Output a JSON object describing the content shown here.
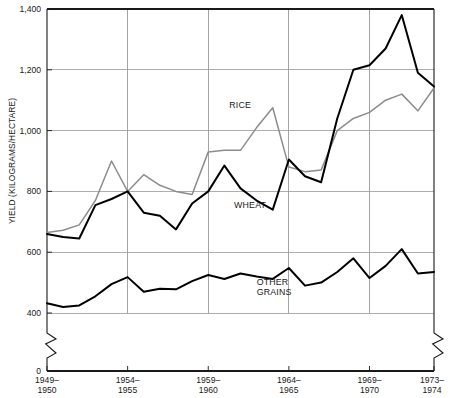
{
  "chart_data": {
    "type": "line",
    "title": "",
    "xlabel": "",
    "ylabel": "YIELD (KILOGRAMS/HECTARE)",
    "ylim": [
      0,
      1400
    ],
    "yticks": [
      0,
      400,
      600,
      800,
      1000,
      1200,
      1400
    ],
    "ytick_labels": [
      "0",
      "400",
      "600",
      "800",
      "1,000",
      "1,200",
      "1,400"
    ],
    "y_axis_break": {
      "present": true,
      "between": [
        0,
        400
      ],
      "note": "zigzag break on both left and right axes"
    },
    "grid": "horizontal and vertical gridlines at labeled ticks",
    "legend_position": "inline labels on plot",
    "xticks": [
      0,
      5,
      10,
      15,
      20,
      24
    ],
    "xtick_labels": [
      {
        "top": "1949–",
        "bottom": "1950"
      },
      {
        "top": "1954–",
        "bottom": "1955"
      },
      {
        "top": "1959–",
        "bottom": "1960"
      },
      {
        "top": "1964–",
        "bottom": "1965"
      },
      {
        "top": "1969–",
        "bottom": "1970"
      },
      {
        "top": "1973–",
        "bottom": "1974"
      }
    ],
    "x": [
      0,
      1,
      2,
      3,
      4,
      5,
      6,
      7,
      8,
      9,
      10,
      11,
      12,
      13,
      14,
      15,
      16,
      17,
      18,
      19,
      20,
      21,
      22,
      23,
      24
    ],
    "series": [
      {
        "name": "RICE",
        "color": "#8c8c8c",
        "label_x": 11.3,
        "label_y": 1075,
        "values": [
          665,
          672,
          690,
          770,
          900,
          800,
          855,
          820,
          800,
          790,
          930,
          935,
          935,
          1010,
          1075,
          880,
          865,
          870,
          1000,
          1040,
          1060,
          1100,
          1120,
          1065,
          1140
        ]
      },
      {
        "name": "WHEAT",
        "color": "#000000",
        "label_x": 11.6,
        "label_y": 745,
        "values": [
          660,
          650,
          645,
          755,
          775,
          800,
          730,
          720,
          675,
          760,
          800,
          885,
          810,
          770,
          740,
          905,
          850,
          830,
          1040,
          1200,
          1215,
          1270,
          1380,
          1190,
          1145
        ]
      },
      {
        "name": "OTHER GRAINS",
        "color": "#000000",
        "label_x": 13.0,
        "label_y": 492,
        "values": [
          432,
          420,
          425,
          455,
          495,
          518,
          470,
          480,
          478,
          505,
          525,
          512,
          530,
          520,
          512,
          548,
          490,
          500,
          535,
          580,
          515,
          555,
          610,
          530,
          535
        ]
      }
    ]
  },
  "icons": {}
}
